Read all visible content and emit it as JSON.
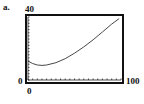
{
  "panel_label": "a.",
  "chart_data": {
    "type": "line",
    "title": "",
    "xlabel": "",
    "ylabel": "",
    "xlim": [
      0,
      100
    ],
    "ylim": [
      0,
      40
    ],
    "tick_labels": {
      "y_max": "40",
      "y_min": "0",
      "x_min": "0",
      "x_max": "100"
    },
    "grid": false,
    "axis_ticks": "dotted tick marks along x and y axes",
    "series": [
      {
        "name": "curve",
        "x": [
          0,
          5,
          10,
          15,
          20,
          30,
          40,
          50,
          60,
          70,
          80,
          90,
          98
        ],
        "y": [
          12,
          10.5,
          9.5,
          9.3,
          9.5,
          11,
          13.5,
          17,
          21,
          25.5,
          30.5,
          35.5,
          39
        ]
      }
    ]
  }
}
